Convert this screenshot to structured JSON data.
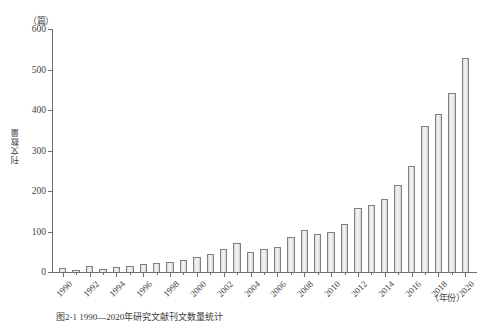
{
  "chart_data": {
    "type": "bar",
    "title": "",
    "caption": "图2-1  1990—2020年研究文献刊文数量统计",
    "xlabel": "（年份）",
    "ylabel": "刊文数量",
    "yunit": "（篇）",
    "ylim": [
      0,
      600
    ],
    "yticks": [
      0,
      100,
      200,
      300,
      400,
      500,
      600
    ],
    "grid": false,
    "legend": "none",
    "xtick_labels": [
      "1990",
      "1992",
      "1994",
      "1996",
      "1998",
      "2000",
      "2002",
      "2004",
      "2006",
      "2008",
      "2010",
      "2012",
      "2014",
      "2016",
      "2018",
      "2020"
    ],
    "categories": [
      "1990",
      "1991",
      "1992",
      "1993",
      "1994",
      "1995",
      "1996",
      "1997",
      "1998",
      "1999",
      "2000",
      "2001",
      "2002",
      "2003",
      "2004",
      "2005",
      "2006",
      "2007",
      "2008",
      "2009",
      "2010",
      "2011",
      "2012",
      "2013",
      "2014",
      "2015",
      "2016",
      "2017",
      "2018",
      "2019",
      "2020"
    ],
    "values": [
      10,
      6,
      14,
      8,
      13,
      15,
      20,
      22,
      25,
      30,
      38,
      45,
      58,
      72,
      50,
      58,
      62,
      87,
      103,
      94,
      98,
      118,
      157,
      166,
      180,
      215,
      262,
      360,
      390,
      443,
      528
    ],
    "bar_fill": "#eeeeee",
    "bar_edge": "#808080"
  }
}
